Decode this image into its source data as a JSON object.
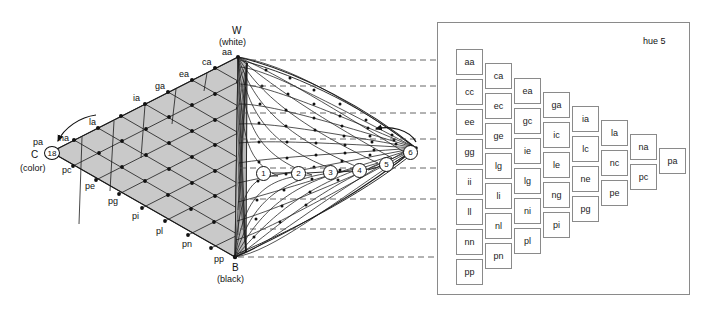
{
  "figure": {
    "title_hue": "hue 5",
    "type": "color-solid-diagram",
    "apex_top": {
      "letter": "W",
      "paren": "(white)",
      "code": "aa"
    },
    "apex_bottom": {
      "letter": "B",
      "paren": "(black)",
      "code": "pp"
    },
    "apex_left": {
      "letter": "C",
      "paren": "(color)",
      "code": "pa",
      "circle": "18"
    },
    "top_edge_labels": [
      "ca",
      "ea",
      "ga",
      "ia",
      "la",
      "na"
    ],
    "bottom_edge_labels": [
      "pc",
      "pe",
      "pg",
      "pi",
      "pl",
      "pn"
    ],
    "chroma_circles": [
      "1",
      "2",
      "3",
      "4",
      "5",
      "6"
    ],
    "value_rows": [
      "aa",
      "cc",
      "ee",
      "gg",
      "ii",
      "ll",
      "nn",
      "pp"
    ],
    "colors": {
      "grid_fill": "#c9c9c9",
      "grid_line": "#1a1a1a",
      "dashed_line": "#555555",
      "panel_border": "#8a8a8a",
      "chip_border": "#8a8a8a",
      "text": "#111111"
    }
  },
  "chart_data": {
    "type": "table",
    "title": "hue 5",
    "xlabel": "chroma step",
    "ylabel": "value step",
    "categories": [
      "c1",
      "c2",
      "c3",
      "c4",
      "c5",
      "c6",
      "c7",
      "c8"
    ],
    "columns": [
      {
        "name": "c1",
        "chroma": 1,
        "chips": [
          "aa",
          "cc",
          "ee",
          "gg",
          "ii",
          "ll",
          "nn",
          "pp"
        ]
      },
      {
        "name": "c2",
        "chroma": 2,
        "chips": [
          "ca",
          "ec",
          "ge",
          "lg",
          "li",
          "nl",
          "pn"
        ]
      },
      {
        "name": "c3",
        "chroma": 3,
        "chips": [
          "ea",
          "gc",
          "ie",
          "lg",
          "ni",
          "pl"
        ]
      },
      {
        "name": "c4",
        "chroma": 4,
        "chips": [
          "ga",
          "ic",
          "le",
          "ng",
          "pi"
        ]
      },
      {
        "name": "c5",
        "chroma": 5,
        "chips": [
          "ia",
          "lc",
          "ne",
          "pg"
        ]
      },
      {
        "name": "c6",
        "chroma": 6,
        "chips": [
          "la",
          "nc",
          "pe"
        ]
      },
      {
        "name": "c7",
        "chroma": 7,
        "chips": [
          "na",
          "pc"
        ]
      },
      {
        "name": "c8",
        "chroma": 8,
        "chips": [
          "pa"
        ]
      }
    ],
    "grid": false,
    "legend": "none"
  },
  "chip_layout": [
    {
      "col": 0,
      "x": 456,
      "y": 49,
      "chips": [
        "aa",
        "cc",
        "ee",
        "gg",
        "ii",
        "ll",
        "nn",
        "pp"
      ],
      "step": 30
    },
    {
      "col": 1,
      "x": 485,
      "y": 63,
      "chips": [
        "ca",
        "ec",
        "ge",
        "lg",
        "li",
        "nl",
        "pn"
      ],
      "step": 30
    },
    {
      "col": 2,
      "x": 514,
      "y": 78,
      "chips": [
        "ea",
        "gc",
        "ie",
        "lg",
        "ni",
        "pl"
      ],
      "step": 30
    },
    {
      "col": 3,
      "x": 543,
      "y": 92,
      "chips": [
        "ga",
        "ic",
        "le",
        "ng",
        "pi"
      ],
      "step": 30
    },
    {
      "col": 4,
      "x": 572,
      "y": 106,
      "chips": [
        "ia",
        "lc",
        "ne",
        "pg"
      ],
      "step": 30
    },
    {
      "col": 5,
      "x": 601,
      "y": 120,
      "chips": [
        "la",
        "nc",
        "pe"
      ],
      "step": 30
    },
    {
      "col": 6,
      "x": 630,
      "y": 134,
      "chips": [
        "na",
        "pc"
      ],
      "step": 30
    },
    {
      "col": 7,
      "x": 659,
      "y": 148,
      "chips": [
        "pa"
      ],
      "step": 30
    }
  ],
  "dashed_rows_y": [
    60,
    86,
    113,
    139,
    168,
    199,
    229,
    257
  ],
  "circle_positions": [
    {
      "n": "1",
      "x": 264,
      "y": 173
    },
    {
      "n": "2",
      "x": 299,
      "y": 173
    },
    {
      "n": "3",
      "x": 331,
      "y": 172
    },
    {
      "n": "4",
      "x": 360,
      "y": 170
    },
    {
      "n": "5",
      "x": 387,
      "y": 164
    },
    {
      "n": "6",
      "x": 411,
      "y": 152
    }
  ]
}
